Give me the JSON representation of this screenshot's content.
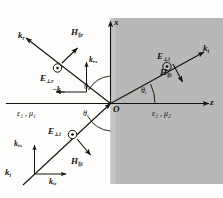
{
  "figure": {
    "background_color": "#fdfdfb",
    "ink_color": "#14120f",
    "medium2_fill": "#b8b8b8",
    "medium2_fill_edge": "#bdbdbd"
  },
  "axes": {
    "x_label": "x",
    "z_label": "z",
    "origin_label": "O"
  },
  "media": {
    "region1": {
      "epsilon": "ε",
      "epsilon_sub": "1",
      "mu": "μ",
      "mu_sub": "1",
      "separator": ",",
      "full": "ε₁ , μ₁"
    },
    "region2": {
      "epsilon": "ε",
      "epsilon_sub": "2",
      "mu": "μ",
      "mu_sub": "2",
      "separator": ",",
      "full": "ε₂ , μ₂"
    }
  },
  "angles": [
    {
      "id": "theta-r",
      "symbol": "θ",
      "sub": "r",
      "name": "reflection-angle"
    },
    {
      "id": "theta-i",
      "symbol": "θ",
      "sub": "i",
      "name": "incidence-angle"
    },
    {
      "id": "theta-t",
      "symbol": "θ",
      "sub": "t",
      "name": "transmission-angle"
    }
  ],
  "incident_wave": {
    "wavevector": {
      "symbol": "k",
      "sub": "i"
    },
    "wavevector_x": {
      "symbol": "k",
      "sub": "ix"
    },
    "wavevector_z": {
      "symbol": "k",
      "sub": "iz"
    },
    "e_field": {
      "symbol": "E",
      "sub": "⊥i"
    },
    "h_field": {
      "symbol": "H",
      "sub": "∥i"
    },
    "e_field_marker": "dot-in-circle"
  },
  "reflected_wave": {
    "wavevector": {
      "symbol": "k",
      "sub": "r"
    },
    "wavevector_x": {
      "symbol": "k",
      "sub": "rx"
    },
    "wavevector_z": {
      "symbol": "−k",
      "sub": "rz"
    },
    "e_field": {
      "symbol": "E",
      "sub": "⊥r"
    },
    "h_field": {
      "symbol": "H",
      "sub": "∥r"
    },
    "e_field_marker": "dot-in-circle"
  },
  "transmitted_wave": {
    "wavevector": {
      "symbol": "k",
      "sub": "t"
    },
    "e_field": {
      "symbol": "E",
      "sub": "⊥t"
    },
    "h_field": {
      "symbol": "H",
      "sub": "∥t"
    },
    "e_field_marker": "dot-in-circle"
  }
}
